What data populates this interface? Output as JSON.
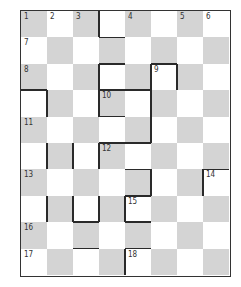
{
  "puzzle": {
    "type": "crossword-grid",
    "cols": 8,
    "rows": 10,
    "colors": {
      "shaded": "#d4d4d4",
      "blank": "#ffffff",
      "line": "#2a2a2a"
    },
    "clue_numbers": [
      {
        "n": "1",
        "r": 0,
        "c": 0
      },
      {
        "n": "2",
        "r": 0,
        "c": 1
      },
      {
        "n": "3",
        "r": 0,
        "c": 2
      },
      {
        "n": "4",
        "r": 0,
        "c": 4
      },
      {
        "n": "5",
        "r": 0,
        "c": 6
      },
      {
        "n": "6",
        "r": 0,
        "c": 7
      },
      {
        "n": "7",
        "r": 1,
        "c": 0
      },
      {
        "n": "8",
        "r": 2,
        "c": 0
      },
      {
        "n": "9",
        "r": 2,
        "c": 5
      },
      {
        "n": "10",
        "r": 3,
        "c": 3
      },
      {
        "n": "11",
        "r": 4,
        "c": 0
      },
      {
        "n": "12",
        "r": 5,
        "c": 3
      },
      {
        "n": "13",
        "r": 6,
        "c": 0
      },
      {
        "n": "14",
        "r": 6,
        "c": 7
      },
      {
        "n": "15",
        "r": 7,
        "c": 4
      },
      {
        "n": "16",
        "r": 8,
        "c": 0
      },
      {
        "n": "17",
        "r": 9,
        "c": 0
      },
      {
        "n": "18",
        "r": 9,
        "c": 4
      }
    ]
  }
}
